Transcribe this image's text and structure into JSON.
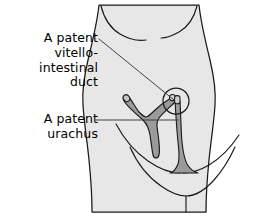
{
  "figure": {
    "kind": "medical-illustration",
    "width": 280,
    "height": 216
  },
  "labels": {
    "vitello_intestinal": "A patent\nvitello-intestinal\nduct",
    "urachus": "A patent\nurachus"
  },
  "structures": {
    "torso": {
      "name": "abdomen",
      "fill": "#e7e7e7",
      "stroke": "#1a1a1a"
    },
    "costal_margin_left": {
      "name": "left-costal-margin",
      "stroke": "#1a1a1a"
    },
    "costal_margin_right": {
      "name": "right-costal-margin",
      "stroke": "#1a1a1a"
    },
    "inguinal_left": {
      "name": "left-inguinal-fold",
      "stroke": "#1a1a1a"
    },
    "inguinal_right": {
      "name": "right-inguinal-fold",
      "stroke": "#1a1a1a"
    },
    "pubic_fold": {
      "name": "pubic-fold",
      "stroke": "#1a1a1a"
    },
    "umbilicus": {
      "name": "umbilicus",
      "cx": 176,
      "cy": 101,
      "r": 13,
      "stroke": "#1a1a1a",
      "fill": "none"
    },
    "vitello_intestinal_duct": {
      "name": "vitello-intestinal-duct",
      "shape": "Y-shaped patent tube",
      "fill": "#9b9b9b",
      "stroke": "#1a1a1a"
    },
    "urachus": {
      "name": "urachus",
      "shape": "tapering tube widening to bladder dome",
      "fill": "#9b9b9b",
      "stroke": "#1a1a1a"
    }
  },
  "leader_lines": {
    "vitello_intestinal": {
      "name": "leader-line-vitello-intestinal",
      "stroke": "#3a3a3a"
    },
    "urachus": {
      "name": "leader-line-urachus",
      "stroke": "#3a3a3a"
    }
  },
  "colors": {
    "page_background": "#ffffff",
    "body_fill": "#e7e7e7",
    "structure_fill": "#9b9b9b",
    "outline": "#1a1a1a",
    "leader": "#3a3a3a",
    "text": "#000000"
  }
}
